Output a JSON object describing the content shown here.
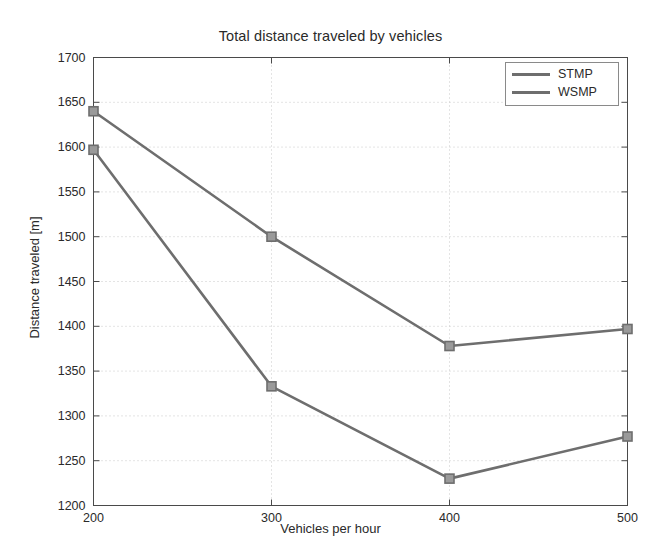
{
  "chart_data": {
    "type": "line",
    "title": "Total distance traveled by vehicles",
    "xlabel": "Vehicles per hour",
    "ylabel": "Distance traveled [m]",
    "x": [
      200,
      300,
      400,
      500
    ],
    "xlim": [
      200,
      500
    ],
    "ylim": [
      1200,
      1700
    ],
    "xticks": [
      "200",
      "300",
      "400",
      "500"
    ],
    "yticks": [
      "1200",
      "1250",
      "1300",
      "1350",
      "1400",
      "1450",
      "1500",
      "1550",
      "1600",
      "1650",
      "1700"
    ],
    "grid": true,
    "legend_position": "top-right",
    "marker": "square",
    "series": [
      {
        "name": "STMP",
        "color": "#6e6e6e",
        "values": [
          1640,
          1500,
          1378,
          1397
        ]
      },
      {
        "name": "WSMP",
        "color": "#6e6e6e",
        "values": [
          1597,
          1333,
          1230,
          1277
        ]
      }
    ]
  },
  "colors": {
    "axis": "#4a4a4a",
    "grid": "#c8c8c8",
    "line": "#6e6e6e",
    "marker_fill": "#9a9a9a",
    "background": "#ffffff"
  }
}
